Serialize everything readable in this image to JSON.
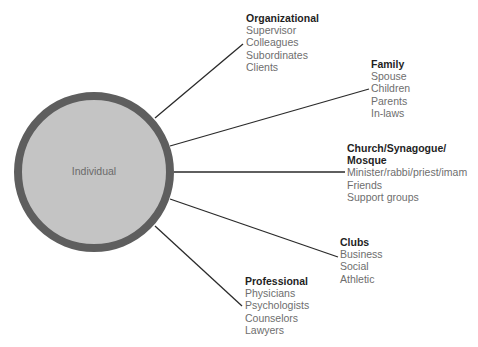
{
  "diagram": {
    "center": {
      "label": "Individual",
      "fill": "#c4c4c4",
      "ring": "#5e5e5e"
    },
    "line_color": "#2a2a2a",
    "nodes": [
      {
        "title": "Organizational",
        "items": [
          "Supervisor",
          "Colleagues",
          "Subordinates",
          "Clients"
        ]
      },
      {
        "title": "Family",
        "items": [
          "Spouse",
          "Children",
          "Parents",
          "In-laws"
        ]
      },
      {
        "title": "Church/Synagogue/",
        "title2": "Mosque",
        "items": [
          "Minister/rabbi/priest/imam",
          "Friends",
          "Support groups"
        ]
      },
      {
        "title": "Clubs",
        "items": [
          "Business",
          "Social",
          "Athletic"
        ]
      },
      {
        "title": "Professional",
        "items": [
          "Physicians",
          "Psychologists",
          "Counselors",
          "Lawyers"
        ]
      }
    ]
  }
}
